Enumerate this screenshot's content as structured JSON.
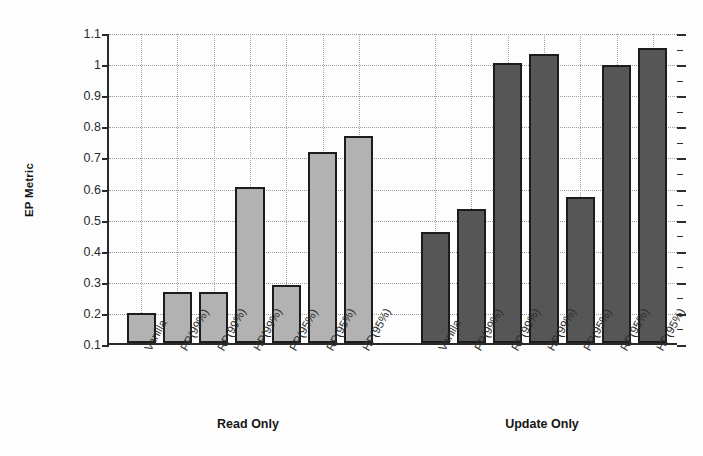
{
  "chart_data": {
    "type": "bar",
    "title": "",
    "subtitle": "",
    "xlabel": "",
    "ylabel": "EP Metric",
    "ylim": [
      0.1,
      1.1
    ],
    "y_ticks": [
      "0.1",
      "0.2",
      "0.3",
      "0.4",
      "0.5",
      "0.6",
      "0.7",
      "0.8",
      "0.9",
      "1",
      "1.1"
    ],
    "y_tick_values": [
      0.1,
      0.2,
      0.3,
      0.4,
      0.5,
      0.6,
      0.7,
      0.8,
      0.9,
      1.0,
      1.1
    ],
    "grid": true,
    "legend_position": "none",
    "categories": [
      "Vanilla",
      "PP(99%)",
      "RP(99%)",
      "HP(99%)",
      "PP(95%)",
      "RP(95%)",
      "HP(95%)"
    ],
    "groups": [
      {
        "name": "Read Only",
        "color": "#b2b2b2",
        "values": [
          0.195,
          0.265,
          0.263,
          0.602,
          0.285,
          0.713,
          0.765
        ]
      },
      {
        "name": "Update Only",
        "color": "#565656",
        "values": [
          0.458,
          0.532,
          1.0,
          1.028,
          0.568,
          0.995,
          1.048
        ]
      }
    ],
    "series": [
      {
        "name": "Read Only",
        "values": [
          0.195,
          0.265,
          0.263,
          0.602,
          0.285,
          0.713,
          0.765
        ]
      },
      {
        "name": "Update Only",
        "values": [
          0.458,
          0.532,
          1.0,
          1.028,
          0.568,
          0.995,
          1.048
        ]
      }
    ],
    "colors": {
      "read_only_bar": "#b2b2b2",
      "update_only_bar": "#565656",
      "bar_outline": "#1c1c1c",
      "axis": "#2a2a2a",
      "gridline": "#9a9a9a",
      "background": "#fdfdfd"
    }
  },
  "axis": {
    "y_title": "EP Metric"
  }
}
